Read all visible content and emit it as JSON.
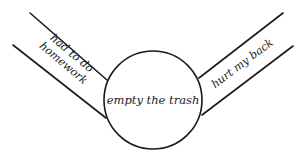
{
  "diagram": {
    "type": "cause-effect-flow",
    "center": {
      "label": "empty the trash"
    },
    "left_branch": {
      "label_line1": "had to do",
      "label_line2": "homework"
    },
    "right_branch": {
      "label": "hurt my back"
    },
    "colors": {
      "stroke": "#1a1a1a",
      "background": "#ffffff"
    }
  }
}
